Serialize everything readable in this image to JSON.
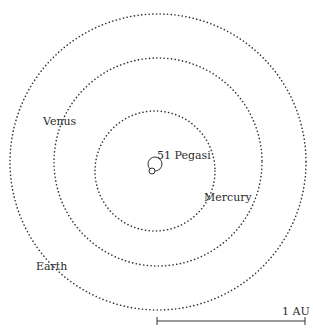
{
  "diagram": {
    "title": "",
    "colors": {
      "ink": "#333333",
      "text": "#2a2a2a",
      "background": "#ffffff"
    },
    "orbits": [
      {
        "name": "Earth",
        "cx": 158,
        "cy": 162,
        "r": 148,
        "style": "dotted"
      },
      {
        "name": "Venus",
        "cx": 158,
        "cy": 162,
        "r": 104,
        "style": "dotted"
      },
      {
        "name": "Mercury",
        "cx": 155,
        "cy": 171,
        "r": 60,
        "style": "dotted"
      }
    ],
    "star_orbit": {
      "name": "51 Pegasi",
      "cx": 155,
      "cy": 164,
      "r": 7,
      "planet_cx": 152,
      "planet_cy": 171,
      "planet_r": 3
    },
    "labels": {
      "earth": "Earth",
      "venus": "Venus",
      "mercury": "Mercury",
      "star": "51 Pegasi",
      "scale": "1 AU"
    },
    "scale_bar": {
      "x1": 157,
      "x2": 305,
      "y": 321,
      "represents": "1 AU"
    }
  }
}
